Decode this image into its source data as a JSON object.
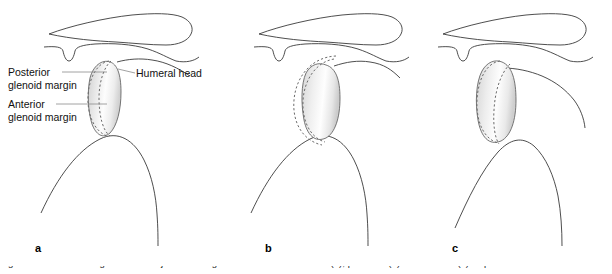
{
  "figure": {
    "type": "medical-illustration",
    "panels": [
      {
        "letter": "a",
        "name": "centered-humeral-head",
        "description": "Humeral head centered on the glenoid; anterior and posterior glenoid margins shown as dashed lines"
      },
      {
        "letter": "b",
        "name": "posterior-subluxation",
        "description": "Humeral head displaced posteriorly relative to the glenoid margins"
      },
      {
        "letter": "c",
        "name": "anterior-subluxation",
        "description": "Humeral head displaced anteriorly relative to the glenoid margins"
      }
    ],
    "annotations": [
      {
        "id": "posterior-glenoid-margin",
        "line1": "Posterior",
        "line2": "glenoid margin"
      },
      {
        "id": "anterior-glenoid-margin",
        "line1": "Anterior",
        "line2": "glenoid margin"
      },
      {
        "id": "humeral-head",
        "line1": "Humeral head",
        "line2": ""
      }
    ],
    "caption": {
      "text": "Fig. 1 Axial view of the glenohumeral joint showing a centered humeral head (a), posterior (b) and anterior (c) displacement."
    },
    "colors": {
      "outline": "#3a3a3a",
      "dashed_margin": "#6b6b6b",
      "head_fill_light": "#ffffff",
      "head_fill_shadow": "#c9c9c9",
      "leader_line": "#8a8a8a",
      "text": "#111111",
      "background": "#ffffff"
    }
  }
}
